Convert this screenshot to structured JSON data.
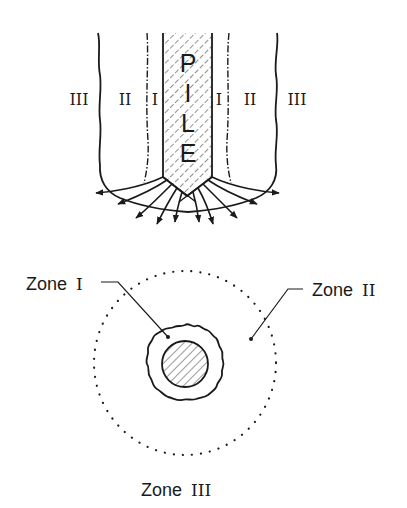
{
  "diagram": {
    "type": "pile-zones-schematic",
    "elevation_view": {
      "pile_letters": [
        "P",
        "I",
        "L",
        "E"
      ],
      "zone_labels_left": [
        "III",
        "II",
        "I"
      ],
      "zone_labels_right": [
        "I",
        "II",
        "III"
      ]
    },
    "plan_view": {
      "zone_1_label": "Zone",
      "zone_1_numeral": "I",
      "zone_2_label": "Zone",
      "zone_2_numeral": "II",
      "zone_3_label": "Zone",
      "zone_3_numeral": "III"
    },
    "colors": {
      "ink": "#1a1a1a",
      "background": "#ffffff"
    }
  }
}
